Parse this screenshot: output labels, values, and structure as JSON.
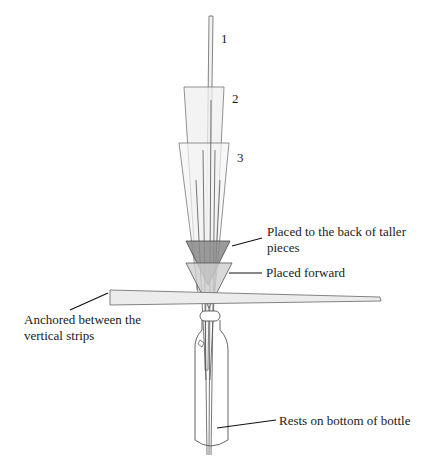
{
  "diagram": {
    "numbers": {
      "piece1": "1",
      "piece2": "2",
      "piece3": "3"
    },
    "callouts": {
      "back": {
        "line1": "Placed to the back of taller",
        "line2": "pieces"
      },
      "forward": "Placed forward",
      "anchored": {
        "line1": "Anchored between the",
        "line2": "vertical strips"
      },
      "rests": "Rests on bottom of bottle"
    }
  }
}
